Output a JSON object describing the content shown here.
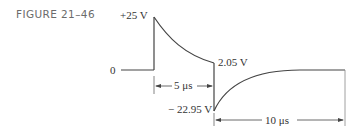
{
  "figure": {
    "label": "FIGURE 21–46"
  },
  "labels": {
    "peak": "+25 V",
    "zero": "0",
    "end_of_decay": "2.05 V",
    "negative_peak": "− 22.95 V",
    "pulse_width": "5 μs",
    "recovery_time": "10 μs"
  },
  "colors": {
    "line": "#444444",
    "text": "#333333",
    "figure_label": "#6b6b6b"
  }
}
